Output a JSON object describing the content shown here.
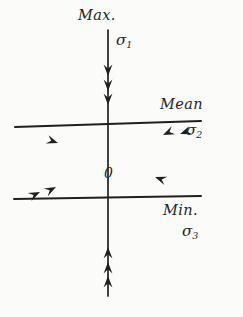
{
  "figure": {
    "kind": "principal-stress-axes-diagram",
    "background_color": "#fbfbf9",
    "ink_color": "#1f1f1f",
    "width": 243,
    "height": 317
  },
  "origin": {
    "label": "0",
    "x": 108,
    "y": 160
  },
  "axes": [
    {
      "id": "sigma1",
      "name_label": "Max.",
      "symbol": "σ",
      "subscript": "1",
      "orientation": "vertical",
      "arrow_count_per_side": 3,
      "arrow_direction": "inward",
      "from": {
        "x": 108,
        "y": 30
      },
      "to": {
        "x": 108,
        "y": 296
      }
    },
    {
      "id": "sigma2",
      "name_label": "Mean",
      "symbol": "σ",
      "subscript": "2",
      "orientation": "diagonal-upper-right",
      "arrow_count_per_side": 2,
      "arrow_direction": "inward",
      "from": {
        "x": 15,
        "y": 127
      },
      "to": {
        "x": 201,
        "y": 121
      }
    },
    {
      "id": "sigma3",
      "name_label": "Min.",
      "symbol": "σ",
      "subscript": "3",
      "orientation": "diagonal-lower-right",
      "arrow_count_per_side": 1,
      "arrow_direction": "inward",
      "from": {
        "x": 14,
        "y": 199
      },
      "to": {
        "x": 201,
        "y": 196
      }
    }
  ],
  "arrowheads": {
    "sigma1_upper": [
      {
        "x": 108,
        "y": 76
      },
      {
        "x": 108,
        "y": 91
      },
      {
        "x": 108,
        "y": 105
      }
    ],
    "sigma1_lower": [
      {
        "x": 108,
        "y": 247
      },
      {
        "x": 108,
        "y": 262
      },
      {
        "x": 108,
        "y": 276
      }
    ],
    "sigma2_left": [
      {
        "x": 58,
        "y": 143
      }
    ],
    "sigma2_right": [
      {
        "x": 163,
        "y": 135
      },
      {
        "x": 180,
        "y": 134
      }
    ],
    "sigma3_left": [
      {
        "x": 40,
        "y": 192
      },
      {
        "x": 56,
        "y": 187
      }
    ],
    "sigma3_right": [
      {
        "x": 155,
        "y": 177
      }
    ]
  }
}
